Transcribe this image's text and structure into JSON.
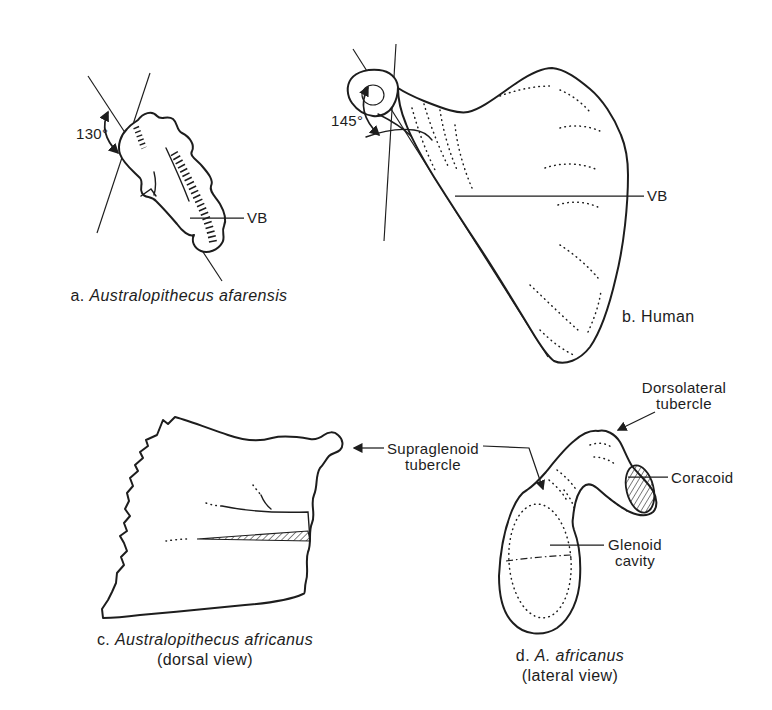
{
  "figure": {
    "colors": {
      "background": "#ffffff",
      "ink": "#1d1d1d"
    },
    "panel_a": {
      "caption_prefix": "a.",
      "caption_species": "Australopithecus afarensis",
      "angle": "130°",
      "vb": "VB"
    },
    "panel_b": {
      "caption_prefix": "b.",
      "caption_name": "Human",
      "angle": "145°",
      "vb": "VB"
    },
    "panel_c": {
      "caption_prefix": "c.",
      "caption_species": "Australopithecus africanus",
      "caption_view": "(dorsal view)"
    },
    "panel_d": {
      "caption_prefix": "d.",
      "caption_species": "A. africanus",
      "caption_view": "(lateral view)"
    },
    "labels": {
      "supraglenoid_1": "Supraglenoid",
      "supraglenoid_2": "tubercle",
      "dorsolateral_1": "Dorsolateral",
      "dorsolateral_2": "tubercle",
      "coracoid": "Coracoid",
      "glenoid_1": "Glenoid",
      "glenoid_2": "cavity"
    }
  }
}
